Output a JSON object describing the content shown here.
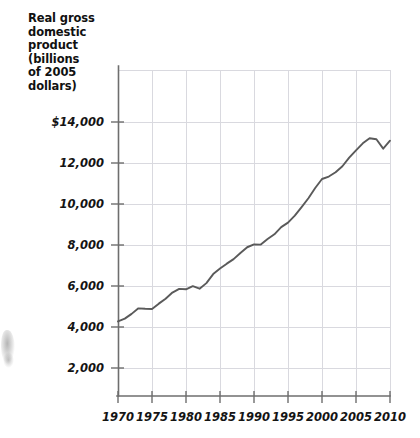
{
  "axis_title": "Real gross\ndomestic\nproduct\n(billions\nof 2005\ndollars)",
  "ylabels": [
    "$14,000",
    "12,000",
    "10,000",
    "8,000",
    "6,000",
    "4,000",
    "2,000"
  ],
  "xlabels": [
    "1970",
    "1975",
    "1980",
    "1985",
    "1990",
    "1995",
    "2000",
    "2005",
    "2010"
  ],
  "colors": {
    "line": "#5a5a5a",
    "axis": "#6e6e6e",
    "grid": "#d8d8de",
    "text": "#141414"
  },
  "chart_data": {
    "type": "line",
    "title": "Real gross domestic product (billions of 2005 dollars)",
    "xlabel": "",
    "ylabel": "Real gross domestic product (billions of 2005 dollars)",
    "xlim": [
      1969,
      2011
    ],
    "ylim": [
      0,
      15000
    ],
    "yticks": [
      2000,
      4000,
      6000,
      8000,
      10000,
      12000,
      14000
    ],
    "ytick_labels": [
      "2,000",
      "4,000",
      "6,000",
      "8,000",
      "10,000",
      "12,000",
      "$14,000"
    ],
    "xticks": [
      1970,
      1975,
      1980,
      1985,
      1990,
      1995,
      2000,
      2005,
      2010
    ],
    "grid": true,
    "legend": false,
    "series": [
      {
        "name": "Real GDP",
        "x": [
          1970,
          1971,
          1972,
          1973,
          1974,
          1975,
          1976,
          1977,
          1978,
          1979,
          1980,
          1981,
          1982,
          1983,
          1984,
          1985,
          1986,
          1987,
          1988,
          1989,
          1990,
          1991,
          1992,
          1993,
          1994,
          1995,
          1996,
          1997,
          1998,
          1999,
          2000,
          2001,
          2002,
          2003,
          2004,
          2005,
          2006,
          2007,
          2008,
          2009,
          2010
        ],
        "values": [
          4270,
          4410,
          4640,
          4910,
          4890,
          4880,
          5140,
          5380,
          5680,
          5860,
          5840,
          5990,
          5870,
          6140,
          6580,
          6850,
          7090,
          7310,
          7610,
          7890,
          8030,
          8020,
          8290,
          8520,
          8870,
          9090,
          9430,
          9850,
          10280,
          10780,
          11220,
          11340,
          11550,
          11840,
          12260,
          12620,
          12960,
          13210,
          13160,
          12700,
          13090
        ]
      }
    ]
  }
}
